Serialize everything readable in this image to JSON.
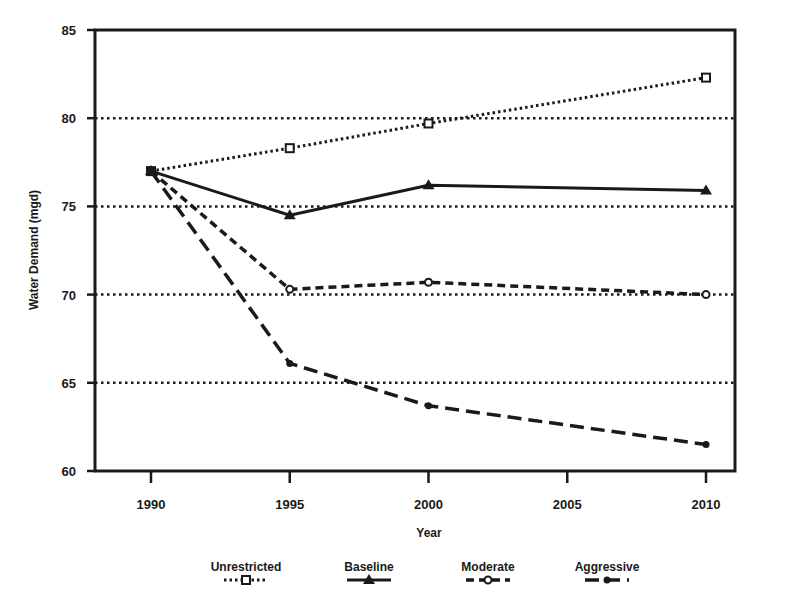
{
  "chart_data": {
    "type": "line",
    "title": "",
    "xlabel": "Year",
    "ylabel": "Water Demand (mgd)",
    "x": [
      1990,
      1995,
      2000,
      2010
    ],
    "x_ticks": [
      "1990",
      "1995",
      "2000",
      "2005",
      "2010"
    ],
    "y_ticks": [
      "60",
      "65",
      "70",
      "75",
      "80",
      "85"
    ],
    "ylim": [
      60,
      85
    ],
    "xlim": [
      1988,
      2012
    ],
    "grid": "horizontal dotted at 65, 70, 75, 80",
    "legend_position": "bottom",
    "series": [
      {
        "name": "Unrestricted",
        "style": "dotted",
        "marker": "square",
        "values": [
          77.0,
          78.3,
          79.7,
          82.3
        ]
      },
      {
        "name": "Baseline",
        "style": "solid",
        "marker": "triangle",
        "values": [
          77.0,
          74.5,
          76.2,
          75.9
        ]
      },
      {
        "name": "Moderate",
        "style": "short-dash",
        "marker": "circle-open",
        "values": [
          77.0,
          70.3,
          70.7,
          70.0
        ]
      },
      {
        "name": "Aggressive",
        "style": "long-dash",
        "marker": "dot",
        "values": [
          77.0,
          66.1,
          63.7,
          61.5
        ]
      }
    ]
  },
  "colors": {
    "ink": "#1a1a1a",
    "background": "#ffffff"
  }
}
